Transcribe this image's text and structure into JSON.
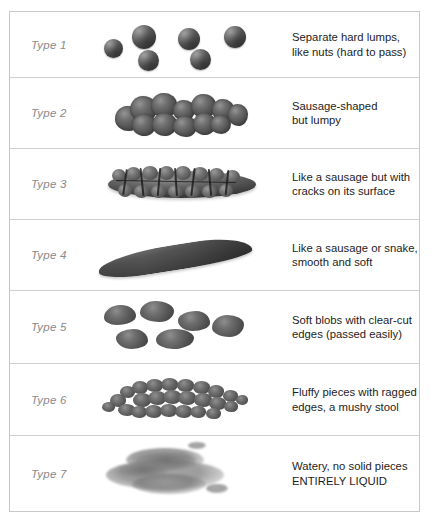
{
  "chart": {
    "border_color": "#c8c8c8",
    "divider_color": "#cfcfcf",
    "label_color": "#8a8a8a",
    "text_color": "#1d1d1d",
    "stool_color": "#4e4e4e",
    "rows": [
      {
        "type_label": "Type 1",
        "description": "Separate hard lumps,\nlike nuts (hard to pass)",
        "art": "separate-hard-lumps"
      },
      {
        "type_label": "Type 2",
        "description": "Sausage-shaped\nbut lumpy",
        "art": "lumpy-sausage"
      },
      {
        "type_label": "Type 3",
        "description": "Like a sausage but with\ncracks on its surface",
        "art": "cracked-sausage"
      },
      {
        "type_label": "Type 4",
        "description": "Like a sausage or snake,\nsmooth and soft",
        "art": "smooth-snake"
      },
      {
        "type_label": "Type 5",
        "description": "Soft blobs with clear-cut\nedges (passed easily)",
        "art": "soft-blobs"
      },
      {
        "type_label": "Type 6",
        "description": "Fluffy pieces with ragged\nedges, a mushy stool",
        "art": "fluffy-mushy-pieces"
      },
      {
        "type_label": "Type 7",
        "description": "Watery, no solid pieces\nENTIRELY LIQUID",
        "art": "watery-liquid"
      }
    ]
  }
}
